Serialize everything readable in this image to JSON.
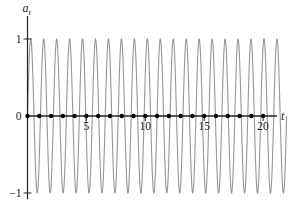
{
  "figure": {
    "background": "#ffffff",
    "curve_color": "#979797",
    "axis_color": "#222222",
    "dot_color": "#0a0a0a",
    "text_color": "#222222"
  },
  "chart_data": {
    "type": "line",
    "title": "",
    "xlabel": "t",
    "ylabel": "a",
    "ylabel_subscript": "t",
    "xlim": [
      0,
      21.2
    ],
    "ylim": [
      -1,
      1
    ],
    "grid": "off",
    "legend": "off",
    "x_ticks": [
      {
        "value": 5,
        "label": "5"
      },
      {
        "value": 10,
        "label": "10"
      },
      {
        "value": 15,
        "label": "15"
      },
      {
        "value": 20,
        "label": "20"
      }
    ],
    "y_ticks": [
      {
        "value": 1,
        "label": "1"
      },
      {
        "value": 0,
        "label": "0"
      },
      {
        "value": -1,
        "label": "-1"
      }
    ],
    "series": [
      {
        "name": "continuous-sinusoid",
        "kind": "curve",
        "description": "high-frequency sine wave, amplitude 1",
        "amplitude": 1,
        "period": 1.1,
        "phase": 0,
        "t_start": 0,
        "t_end": 22.0,
        "color": "#979797"
      },
      {
        "name": "sampled-points",
        "kind": "points",
        "description": "samples a_t at unit intervals, all equal to zero",
        "x": [
          0,
          1,
          2,
          3,
          4,
          5,
          6,
          7,
          8,
          9,
          10,
          11,
          12,
          13,
          14,
          15,
          16,
          17,
          18,
          19,
          20
        ],
        "y": [
          0,
          0,
          0,
          0,
          0,
          0,
          0,
          0,
          0,
          0,
          0,
          0,
          0,
          0,
          0,
          0,
          0,
          0,
          0,
          0,
          0
        ],
        "color": "#0a0a0a"
      }
    ],
    "geometry": {
      "width": 297,
      "height": 210,
      "origin_x": 27.5,
      "origin_y": 116,
      "px_per_unit_x": 11.78,
      "px_per_unit_y": 77,
      "x_axis_end": 277,
      "y_axis_top": 16,
      "y_axis_bottom": 199
    }
  }
}
